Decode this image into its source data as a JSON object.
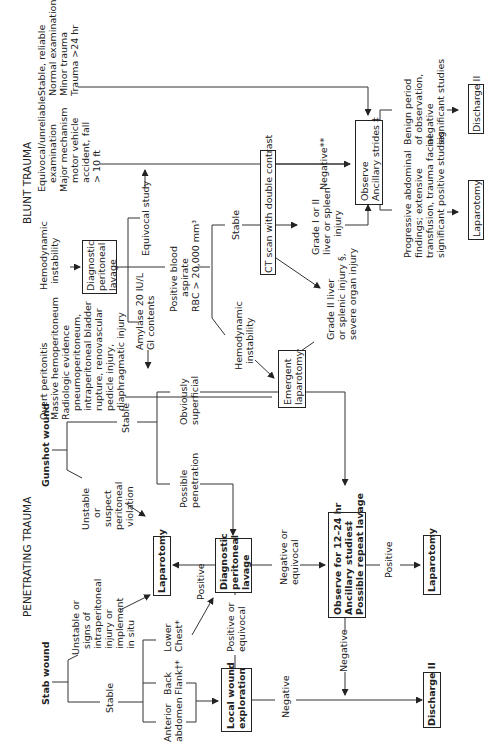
{
  "headings": {
    "blunt": "BLUNT TRAUMA",
    "penetrating": "PENETRATING TRAUMA"
  },
  "blunt": {
    "stable_reliable": "Stable, reliable\nNormal examination\nMinor trauma\nTrauma >24 hr",
    "equivocal_exam": "Equivocal/unreliable\n   examination\nMajor mechanism\n   motor vehicle\n   accident, fall\n   > 10 ft",
    "hemodynamic_instability": "Hemodynamic\n  instability",
    "dpl": "Diagnostic\nperitoneal\nlavage",
    "equivocal_study": "Equivocal study",
    "positive_blood": "Positive blood\n     aspirate\nRBC > 20,000 mm³",
    "amylase": "Amylase 20 IU/L\nGI contents",
    "overt": "Overt peritonitis\nMassive hemoperitoneum\nRadiologic evidence\n   pneumoperitoneum,\n   intraperitoneal bladder\n   rupture, renovascular\n   pedicle injury,\n   diaphragmatic injury",
    "stable": "Stable",
    "hemo_instability2": "Hemodynamic\n  instability",
    "ct_scan": "CT scan with double contrast",
    "negative_star": "Negative**",
    "grade_1_2": "Grade I or II\nliver or spleen\n      injury",
    "grade_2_severe": "Grade II liver\nor splenic injury §,\nsevere organ injury",
    "emergent_lap": "Emergent\nlaparotomy",
    "observe": "Observe\nAncillary strides ‡",
    "benign": "Benign period\nof observation,\nnegative\nsignificant studies",
    "progressive": "Progressive abdominal\nfindings; extensive\ntransfusion, trauma facial\nsignificant positive studies",
    "laparotomy": "Laparotomy",
    "discharge": "Discharge II"
  },
  "penetrating": {
    "gunshot": "Gunshot wound",
    "stab": "Stab wound",
    "gsw_unstable": "Unstable\n    or\n suspect\nperitoneal\n violation",
    "gsw_stable": "Stable",
    "obviously_superficial": "Obviously\nsuperficial",
    "possible_penetration": "Possible\npenetration",
    "stab_unstable": "Unstable or\n  signs of\n  intraperitoneal\n  injury or\n  implement\n  in situ",
    "stab_stable": "Stable",
    "lower_chest": "Lower\nChest*",
    "back_flank": "Back\nFlank†*",
    "anterior_abdomen": "Anterior\nabdomen",
    "laparotomy": "Laparotomy",
    "positive": "Positive",
    "dpl": "Diagnostic\nperitoneal\nlavage",
    "positive_or_equivocal": "Positive or\nequivocal",
    "local_wound": "Local wound\nexploration",
    "negative_or_equivocal": "Negative or\nequivocal",
    "observe": "Observe for 12–24 hr\nAncillary studies‡\nPossible repeat lavage",
    "positive2": "Positive",
    "laparotomy2": "Laparotomy",
    "negative": "Negative",
    "negative2": "Negative",
    "discharge": "Discharge II"
  }
}
